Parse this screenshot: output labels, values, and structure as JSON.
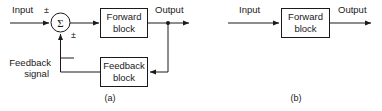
{
  "figure": {
    "type": "block-diagram",
    "background_color": "#ffffff",
    "line_color": "#1a1a1a"
  },
  "panel_a": {
    "caption": "(a)",
    "input_label": "Input",
    "input_sign": "±",
    "summing_junction_symbol": "Σ",
    "feedback_sign": "±",
    "forward_block_line1": "Forward",
    "forward_block_line2": "block",
    "feedback_block_line1": "Feedback",
    "feedback_block_line2": "block",
    "feedback_signal_line1": "Feedback",
    "feedback_signal_line2": "signal",
    "output_label": "Output"
  },
  "panel_b": {
    "caption": "(b)",
    "input_label": "Input",
    "forward_block_line1": "Forward",
    "forward_block_line2": "block",
    "output_label": "Output"
  }
}
